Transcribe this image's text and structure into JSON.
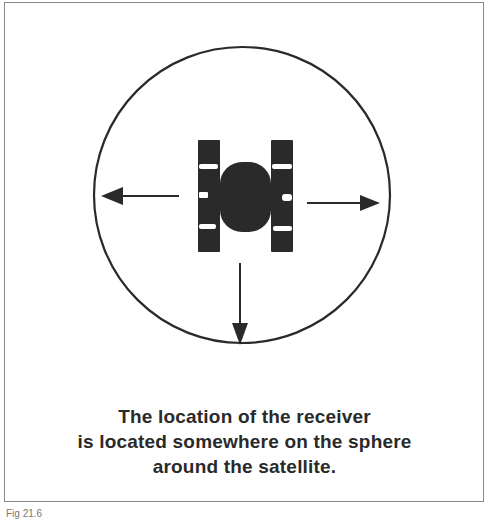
{
  "figure": {
    "caption_lines": [
      "The location of the receiver",
      "is located somewhere on the sphere",
      "around the satellite."
    ],
    "fig_label": "Fig 21.6"
  },
  "diagram": {
    "sphere": {
      "cx": 242,
      "cy": 195,
      "r": 148
    },
    "satellite": {
      "icon": "satellite-icon"
    },
    "arrows": [
      {
        "direction": "left",
        "icon": "arrow-left-icon"
      },
      {
        "direction": "right",
        "icon": "arrow-right-icon"
      },
      {
        "direction": "down",
        "icon": "arrow-down-icon"
      }
    ],
    "colors": {
      "ink": "#2a2a2a",
      "frame": "#8a8a8a",
      "background": "#ffffff"
    }
  }
}
